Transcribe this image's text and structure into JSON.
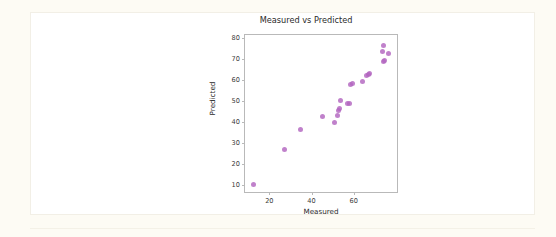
{
  "page": {
    "background_color": "#fdfbf4",
    "card_background_color": "#ffffff"
  },
  "chart_data": {
    "type": "scatter",
    "title": "Measured vs Predicted",
    "xlabel": "Measured",
    "ylabel": "Predicted",
    "xlim": [
      8,
      80
    ],
    "ylim": [
      7,
      82
    ],
    "xticks": [
      20,
      40,
      60
    ],
    "yticks": [
      10,
      20,
      30,
      40,
      50,
      60,
      70,
      80
    ],
    "xtick_labels": [
      "20",
      "40",
      "60"
    ],
    "ytick_labels": [
      "10",
      "20",
      "30",
      "40",
      "50",
      "60",
      "70",
      "80"
    ],
    "grid": false,
    "legend": null,
    "marker_color": "#b265c0",
    "series": [
      {
        "name": "observations",
        "points": [
          [
            12.0,
            10.8
          ],
          [
            26.8,
            27.5
          ],
          [
            34.2,
            37.0
          ],
          [
            44.5,
            43.0
          ],
          [
            50.5,
            40.3
          ],
          [
            51.8,
            43.5
          ],
          [
            52.4,
            46.0
          ],
          [
            52.9,
            46.8
          ],
          [
            53.2,
            50.8
          ],
          [
            56.6,
            49.3
          ],
          [
            57.3,
            49.4
          ],
          [
            58.1,
            58.2
          ],
          [
            58.8,
            58.6
          ],
          [
            63.6,
            60.0
          ],
          [
            65.5,
            62.5
          ],
          [
            66.4,
            63.3
          ],
          [
            67.2,
            63.7
          ],
          [
            73.2,
            74.3
          ],
          [
            73.6,
            77.2
          ],
          [
            73.8,
            69.3
          ],
          [
            74.2,
            69.6
          ],
          [
            76.0,
            73.4
          ]
        ]
      }
    ]
  }
}
